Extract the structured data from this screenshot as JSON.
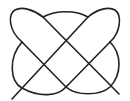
{
  "diagram": {
    "type": "knot-line-drawing",
    "stroke_color": "#222222",
    "background_color": "#ffffff",
    "crossings": [
      [
        22,
        42
      ],
      [
        43,
        17
      ],
      [
        66,
        41
      ],
      [
        88,
        17
      ],
      [
        110,
        42
      ],
      [
        44,
        64
      ],
      [
        88,
        64
      ],
      [
        22,
        88
      ],
      [
        66,
        87
      ]
    ]
  }
}
